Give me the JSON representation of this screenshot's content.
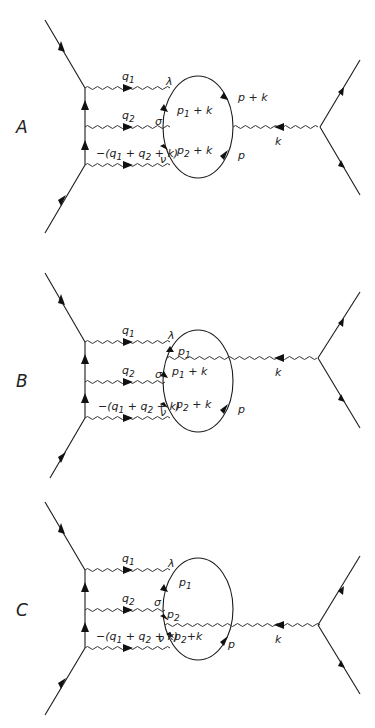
{
  "panels": [
    {
      "id": "A",
      "label": "A",
      "photon_labels": {
        "top": "q1",
        "mid": "q2",
        "bot": "-(q1+q2+k)"
      },
      "vertex_labels": {
        "top": "λ",
        "mid": "σ",
        "bot": "ν"
      },
      "loop_labels": [
        "p1 + k",
        "p2 + k",
        "p + k",
        "p"
      ],
      "external_photon": "k"
    },
    {
      "id": "B",
      "label": "B",
      "photon_labels": {
        "top": "q1",
        "mid": "q2",
        "bot": "-(q1+q2+k)"
      },
      "vertex_labels": {
        "top": "λ",
        "mid": "σ",
        "bot": "ν"
      },
      "loop_labels": [
        "p1",
        "p1 + k",
        "p2 + k",
        "p"
      ],
      "external_photon": "k"
    },
    {
      "id": "C",
      "label": "C",
      "photon_labels": {
        "top": "q1",
        "mid": "q2",
        "bot": "-(q1+q2+k)"
      },
      "vertex_labels": {
        "top": "λ",
        "mid": "σ",
        "bot": "ν"
      },
      "loop_labels": [
        "p1",
        "p2",
        "p2+k",
        "p"
      ],
      "external_photon": "k"
    }
  ],
  "text": {
    "A": "A",
    "B": "B",
    "C": "C",
    "q1": "q",
    "q2": "q",
    "sub1": "1",
    "sub2": "2",
    "k": "k",
    "p": "p",
    "lambda": "λ",
    "sigma": "σ",
    "nu": "ν",
    "neg_open": "−(q",
    "plus": " + q",
    "plusk": " + k)",
    "p1k_p": "p",
    "p1k_rest": " + k",
    "pk": "p + k",
    "p2k_tight": "+k"
  }
}
